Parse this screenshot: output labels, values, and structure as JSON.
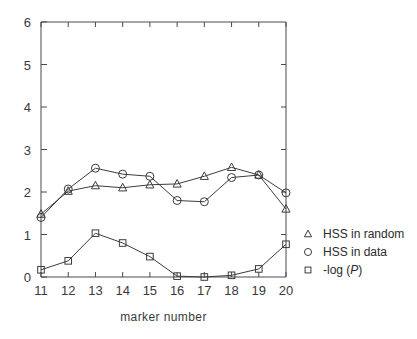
{
  "chart_data": {
    "type": "line",
    "title": "",
    "xlabel": "marker  number",
    "ylabel": "",
    "x": [
      11,
      12,
      13,
      14,
      15,
      16,
      17,
      18,
      19,
      20
    ],
    "categories": [
      "11",
      "12",
      "13",
      "14",
      "15",
      "16",
      "17",
      "18",
      "19",
      "20"
    ],
    "xlim": [
      11,
      20
    ],
    "ylim": [
      0,
      6
    ],
    "xticks": [
      11,
      12,
      13,
      14,
      15,
      16,
      17,
      18,
      19,
      20
    ],
    "yticks": [
      0,
      1,
      2,
      3,
      4,
      5,
      6
    ],
    "xtick_labels": [
      "11",
      "12",
      "13",
      "14",
      "15",
      "16",
      "17",
      "18",
      "19",
      "20"
    ],
    "ytick_labels": [
      "0",
      "1",
      "2",
      "3",
      "4",
      "5",
      "6"
    ],
    "grid": false,
    "legend_position": "right-outside",
    "series": [
      {
        "name": "HSS in random",
        "marker": "triangle",
        "values": [
          1.48,
          2.02,
          2.15,
          2.1,
          2.17,
          2.19,
          2.37,
          2.58,
          2.4,
          1.6
        ]
      },
      {
        "name": "HSS in data",
        "marker": "circle",
        "values": [
          1.4,
          2.07,
          2.56,
          2.42,
          2.37,
          1.8,
          1.77,
          2.34,
          2.4,
          1.98
        ]
      },
      {
        "name": "-log (P)",
        "marker": "square",
        "values": [
          0.17,
          0.38,
          1.03,
          0.8,
          0.48,
          0.02,
          0.0,
          0.04,
          0.19,
          0.77
        ]
      }
    ],
    "colors": {
      "line": "#3c3c3c",
      "axis": "#4a4a4a",
      "text": "#3a3a3a",
      "background": "#ffffff"
    }
  },
  "legend": {
    "entries": [
      {
        "label": "HSS in random",
        "marker": "triangle"
      },
      {
        "label": "HSS in data",
        "marker": "circle"
      },
      {
        "label": "-log (",
        "suffix": ")",
        "italic": "P",
        "marker": "square"
      }
    ]
  },
  "axes": {
    "x_title": "marker  number"
  }
}
